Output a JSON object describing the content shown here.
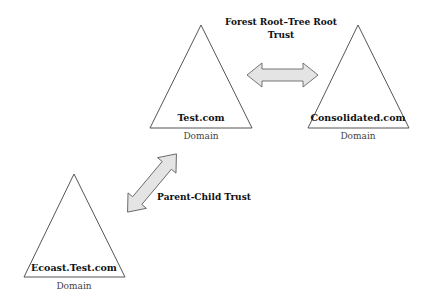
{
  "diagram": {
    "domains": [
      {
        "id": "test",
        "name": "Test.com",
        "type": "Domain"
      },
      {
        "id": "consolidated",
        "name": "Consolidated.com",
        "type": "Domain"
      },
      {
        "id": "ecoast",
        "name": "Ecoast.Test.com",
        "type": "Domain"
      }
    ],
    "trusts": [
      {
        "id": "forest-root-tree-root",
        "label_line1": "Forest Root–Tree Root",
        "label_line2": "Trust",
        "from": "test",
        "to": "consolidated",
        "direction": "bidirectional"
      },
      {
        "id": "parent-child",
        "label": "Parent-Child Trust",
        "from": "test",
        "to": "ecoast",
        "direction": "bidirectional"
      }
    ],
    "colors": {
      "triangle_stroke": "#555555",
      "arrow_fill": "#e4e4e4",
      "arrow_stroke": "#666666",
      "background": "#ffffff"
    }
  }
}
